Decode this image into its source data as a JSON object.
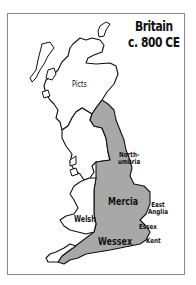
{
  "map": {
    "title_line1": "Britain",
    "title_line2": "c. 800 CE",
    "fill_color": "#a8a8a8",
    "outline_color": "#111111",
    "background_color": "#ffffff",
    "regions": [
      {
        "id": "picts",
        "label": "Picts",
        "shaded": false
      },
      {
        "id": "northumbria",
        "label_line1": "North-",
        "label_line2": "umbria",
        "shaded": true
      },
      {
        "id": "mercia",
        "label": "Mercia",
        "shaded": true
      },
      {
        "id": "east-anglia",
        "label_line1": "East",
        "label_line2": "Anglia",
        "shaded": true
      },
      {
        "id": "welsh",
        "label": "Welsh",
        "shaded": false
      },
      {
        "id": "essex",
        "label": "Essex",
        "shaded": true
      },
      {
        "id": "wessex",
        "label": "Wessex",
        "shaded": true
      },
      {
        "id": "kent",
        "label": "Kent",
        "shaded": true
      }
    ]
  }
}
